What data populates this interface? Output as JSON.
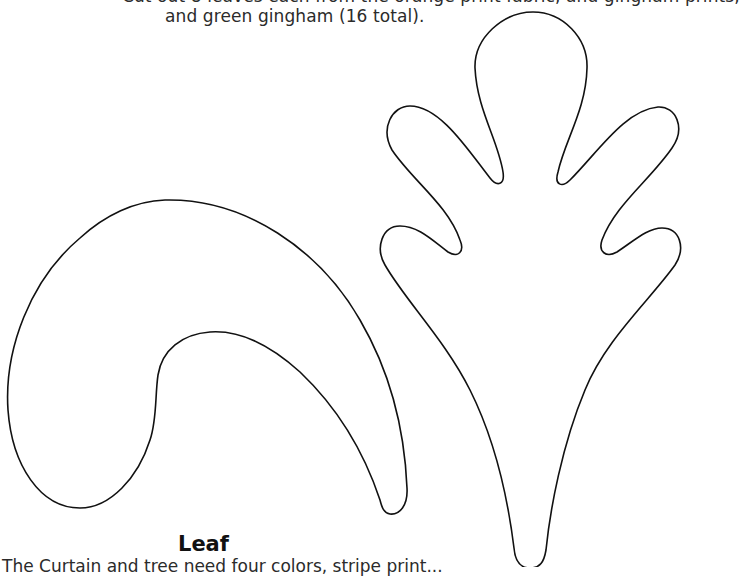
{
  "document": {
    "intro": {
      "line_clipped": "Cut out 8 leaves each from the orange print fabric, and gingham prints,",
      "line_visible": "and green gingham (16 total)."
    },
    "templates": [
      {
        "id": "curled-leaf",
        "shape": "curled-teardrop-leaf-outline"
      },
      {
        "id": "oak-leaf",
        "shape": "five-lobed-oak-leaf-outline-with-stem"
      }
    ],
    "caption": {
      "title": "Leaf",
      "description": "The Curtain and tree need four colors, stripe print..."
    },
    "colors": {
      "background": "#ffffff",
      "outline": "#111111",
      "text": "#2b2b2b"
    }
  }
}
